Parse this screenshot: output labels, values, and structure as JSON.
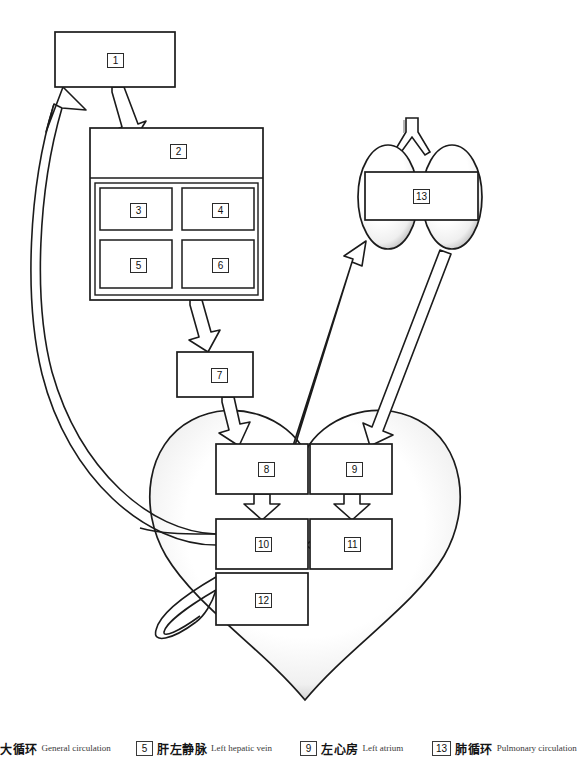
{
  "diagram": {
    "stroke_color": "#1b1b1b",
    "fill_color": "#ffffff",
    "shading_color": "#b8b8b8",
    "boxes": [
      {
        "id": "1",
        "label": "1",
        "x": 55,
        "y": 32,
        "w": 120,
        "h": 55
      },
      {
        "id": "2",
        "label": "2",
        "x": 90,
        "y": 128,
        "w": 173,
        "h": 172
      },
      {
        "id": "3",
        "label": "3",
        "x": 100,
        "y": 188,
        "w": 72,
        "h": 42
      },
      {
        "id": "4",
        "label": "4",
        "x": 182,
        "y": 188,
        "w": 72,
        "h": 42
      },
      {
        "id": "5",
        "label": "5",
        "x": 100,
        "y": 240,
        "w": 72,
        "h": 48
      },
      {
        "id": "6",
        "label": "6",
        "x": 182,
        "y": 240,
        "w": 72,
        "h": 48
      },
      {
        "id": "7",
        "label": "7",
        "x": 177,
        "y": 352,
        "w": 76,
        "h": 45
      },
      {
        "id": "8",
        "label": "8",
        "x": 216,
        "y": 444,
        "w": 92,
        "h": 50
      },
      {
        "id": "9",
        "label": "9",
        "x": 310,
        "y": 444,
        "w": 82,
        "h": 50
      },
      {
        "id": "10",
        "label": "10",
        "x": 216,
        "y": 519,
        "w": 92,
        "h": 50
      },
      {
        "id": "11",
        "label": "11",
        "x": 310,
        "y": 519,
        "w": 82,
        "h": 50
      },
      {
        "id": "12",
        "label": "12",
        "x": 216,
        "y": 573,
        "w": 92,
        "h": 52
      },
      {
        "id": "13",
        "label": "13",
        "x": 365,
        "y": 172,
        "w": 113,
        "h": 48
      }
    ],
    "organs": [
      {
        "name": "heart",
        "id": "heart-shape"
      },
      {
        "name": "lungs",
        "id": "lungs-shape"
      },
      {
        "name": "trachea",
        "id": "trachea-shape"
      }
    ],
    "arrows": [
      {
        "name": "arrow-1-to-2",
        "from": "1",
        "to": "2"
      },
      {
        "name": "arrow-2-to-7",
        "from": "2",
        "to": "7"
      },
      {
        "name": "arrow-7-to-8",
        "from": "7",
        "to": "8"
      },
      {
        "name": "arrow-8-to-10",
        "from": "8",
        "to": "10"
      },
      {
        "name": "arrow-9-to-11",
        "from": "9",
        "to": "11"
      },
      {
        "name": "arrow-11-to-10",
        "from": "11",
        "to": "10"
      },
      {
        "name": "arrow-heart-to-lungs",
        "from": "11",
        "to": "13"
      },
      {
        "name": "arrow-lungs-to-9",
        "from": "13",
        "to": "9"
      },
      {
        "name": "arrow-circulation-to-1",
        "from": "10",
        "to": "1"
      },
      {
        "name": "vessel-10-inflow",
        "from": "body",
        "to": "10"
      },
      {
        "name": "vessel-12-loop",
        "from": "12",
        "to": "12"
      }
    ]
  },
  "legend": {
    "items": [
      {
        "num": "",
        "cn": "大循环",
        "en": "General circulation",
        "x": 0
      },
      {
        "num": "5",
        "cn": "肝左静脉",
        "en": "Left hepatic vein",
        "x": 136
      },
      {
        "num": "9",
        "cn": "左心房",
        "en": "Left atrium",
        "x": 300
      },
      {
        "num": "13",
        "cn": "肺循环",
        "en": "Pulmonary circulation",
        "x": 432
      }
    ]
  }
}
